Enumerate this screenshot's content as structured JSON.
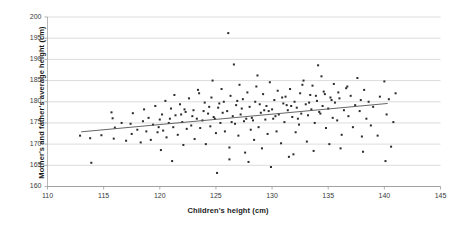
{
  "chart_data": {
    "type": "scatter",
    "title": "",
    "xlabel": "Children's height (cm)",
    "ylabel": "Mother's and father's average height (cm)",
    "xlim": [
      110,
      145
    ],
    "ylim": [
      160,
      200
    ],
    "xticks": [
      110,
      115,
      120,
      125,
      130,
      135,
      140,
      145
    ],
    "yticks": [
      160,
      165,
      170,
      175,
      180,
      185,
      190,
      195,
      200
    ],
    "grid": "horizontal",
    "legend": "none",
    "marker_color": "#2b2b2b",
    "marker_shape": "square",
    "marker_size_px": 2.0,
    "trendline": {
      "type": "linear",
      "color": "#555555",
      "x_start": 113.0,
      "y_start": 172.9,
      "x_end": 140.3,
      "y_end": 179.6,
      "slope": 0.245,
      "intercept": 145.2
    },
    "points": [
      [
        112.9,
        172.0
      ],
      [
        113.8,
        171.4
      ],
      [
        113.9,
        165.6
      ],
      [
        114.8,
        172.1
      ],
      [
        115.7,
        177.5
      ],
      [
        115.8,
        176.1
      ],
      [
        115.9,
        171.3
      ],
      [
        116.0,
        173.9
      ],
      [
        116.6,
        175.0
      ],
      [
        117.0,
        170.8
      ],
      [
        117.4,
        174.8
      ],
      [
        117.5,
        172.4
      ],
      [
        117.6,
        177.3
      ],
      [
        118.0,
        173.4
      ],
      [
        118.3,
        170.4
      ],
      [
        118.5,
        175.4
      ],
      [
        118.6,
        178.2
      ],
      [
        118.8,
        173.0
      ],
      [
        119.0,
        176.2
      ],
      [
        119.2,
        171.0
      ],
      [
        119.4,
        174.6
      ],
      [
        119.6,
        179.0
      ],
      [
        119.8,
        172.8
      ],
      [
        120.0,
        175.8
      ],
      [
        120.1,
        168.6
      ],
      [
        120.2,
        177.0
      ],
      [
        120.3,
        173.2
      ],
      [
        120.5,
        180.2
      ],
      [
        120.6,
        171.6
      ],
      [
        120.8,
        175.0
      ],
      [
        121.0,
        178.4
      ],
      [
        121.1,
        166.0
      ],
      [
        121.2,
        174.0
      ],
      [
        121.4,
        176.8
      ],
      [
        121.6,
        172.2
      ],
      [
        121.8,
        179.4
      ],
      [
        122.0,
        175.2
      ],
      [
        122.1,
        169.8
      ],
      [
        122.3,
        177.6
      ],
      [
        122.4,
        173.6
      ],
      [
        122.6,
        180.8
      ],
      [
        122.8,
        174.4
      ],
      [
        123.0,
        178.0
      ],
      [
        123.1,
        171.2
      ],
      [
        123.3,
        176.0
      ],
      [
        123.5,
        182.0
      ],
      [
        123.6,
        173.8
      ],
      [
        123.8,
        175.6
      ],
      [
        124.0,
        179.8
      ],
      [
        124.1,
        170.0
      ],
      [
        124.3,
        177.2
      ],
      [
        124.5,
        174.2
      ],
      [
        124.6,
        181.0
      ],
      [
        124.8,
        176.4
      ],
      [
        125.0,
        172.6
      ],
      [
        125.1,
        163.2
      ],
      [
        125.2,
        178.6
      ],
      [
        125.4,
        175.0
      ],
      [
        125.5,
        183.0
      ],
      [
        125.7,
        180.0
      ],
      [
        125.8,
        173.0
      ],
      [
        126.0,
        177.8
      ],
      [
        126.1,
        196.2
      ],
      [
        126.2,
        169.2
      ],
      [
        126.3,
        181.4
      ],
      [
        126.5,
        176.6
      ],
      [
        126.6,
        188.8
      ],
      [
        126.7,
        174.8
      ],
      [
        126.8,
        179.2
      ],
      [
        127.0,
        172.0
      ],
      [
        127.1,
        184.0
      ],
      [
        127.2,
        177.0
      ],
      [
        127.4,
        180.6
      ],
      [
        127.5,
        175.4
      ],
      [
        127.6,
        168.0
      ],
      [
        127.8,
        182.2
      ],
      [
        128.0,
        178.8
      ],
      [
        128.1,
        173.4
      ],
      [
        128.2,
        176.2
      ],
      [
        128.4,
        171.0
      ],
      [
        128.5,
        180.0
      ],
      [
        128.6,
        183.6
      ],
      [
        128.8,
        174.0
      ],
      [
        129.0,
        177.4
      ],
      [
        129.1,
        169.0
      ],
      [
        129.2,
        181.8
      ],
      [
        129.4,
        175.8
      ],
      [
        129.5,
        179.0
      ],
      [
        129.6,
        172.4
      ],
      [
        129.8,
        184.6
      ],
      [
        130.0,
        178.2
      ],
      [
        130.1,
        176.0
      ],
      [
        130.2,
        180.4
      ],
      [
        130.4,
        173.0
      ],
      [
        130.5,
        182.6
      ],
      [
        130.6,
        177.0
      ],
      [
        130.8,
        170.2
      ],
      [
        131.0,
        179.6
      ],
      [
        131.1,
        175.2
      ],
      [
        131.2,
        181.2
      ],
      [
        131.4,
        178.0
      ],
      [
        131.5,
        167.0
      ],
      [
        131.6,
        183.0
      ],
      [
        131.8,
        176.4
      ],
      [
        132.0,
        180.0
      ],
      [
        132.1,
        172.8
      ],
      [
        132.2,
        178.6
      ],
      [
        132.4,
        174.6
      ],
      [
        132.5,
        182.0
      ],
      [
        132.6,
        177.2
      ],
      [
        132.8,
        185.0
      ],
      [
        133.0,
        179.4
      ],
      [
        133.1,
        170.6
      ],
      [
        133.2,
        176.8
      ],
      [
        133.4,
        181.6
      ],
      [
        133.5,
        178.2
      ],
      [
        133.6,
        183.8
      ],
      [
        133.8,
        175.0
      ],
      [
        134.0,
        180.2
      ],
      [
        134.1,
        188.6
      ],
      [
        134.2,
        177.6
      ],
      [
        134.4,
        186.0
      ],
      [
        134.5,
        179.0
      ],
      [
        134.6,
        182.4
      ],
      [
        134.8,
        173.8
      ],
      [
        135.0,
        178.4
      ],
      [
        135.1,
        170.0
      ],
      [
        135.2,
        181.0
      ],
      [
        135.4,
        176.2
      ],
      [
        135.5,
        184.2
      ],
      [
        135.6,
        179.8
      ],
      [
        135.8,
        175.6
      ],
      [
        136.0,
        180.8
      ],
      [
        136.2,
        172.2
      ],
      [
        136.4,
        178.0
      ],
      [
        136.6,
        183.2
      ],
      [
        136.8,
        176.6
      ],
      [
        137.0,
        181.4
      ],
      [
        137.2,
        174.0
      ],
      [
        137.4,
        179.2
      ],
      [
        137.6,
        185.6
      ],
      [
        137.8,
        177.8
      ],
      [
        138.0,
        171.8
      ],
      [
        138.2,
        182.8
      ],
      [
        138.4,
        176.0
      ],
      [
        138.6,
        180.0
      ],
      [
        138.8,
        174.4
      ],
      [
        139.0,
        178.8
      ],
      [
        139.4,
        172.0
      ],
      [
        139.6,
        181.2
      ],
      [
        140.0,
        184.8
      ],
      [
        140.2,
        177.0
      ],
      [
        140.4,
        180.6
      ],
      [
        140.6,
        169.4
      ],
      [
        140.8,
        175.2
      ],
      [
        141.0,
        182.0
      ],
      [
        124.9,
        176.0
      ],
      [
        125.3,
        179.6
      ],
      [
        126.4,
        175.2
      ],
      [
        127.3,
        178.4
      ],
      [
        128.3,
        175.6
      ],
      [
        129.3,
        178.0
      ],
      [
        130.3,
        176.6
      ],
      [
        131.3,
        179.2
      ],
      [
        132.3,
        176.0
      ],
      [
        133.3,
        179.8
      ],
      [
        134.3,
        177.2
      ],
      [
        135.3,
        180.4
      ],
      [
        122.9,
        176.6
      ],
      [
        123.9,
        177.8
      ],
      [
        124.4,
        178.8
      ],
      [
        126.9,
        180.2
      ],
      [
        128.9,
        179.4
      ],
      [
        130.9,
        181.0
      ],
      [
        133.9,
        181.4
      ],
      [
        134.7,
        181.8
      ],
      [
        119.9,
        174.0
      ],
      [
        120.9,
        176.0
      ],
      [
        121.9,
        177.0
      ],
      [
        122.2,
        178.2
      ],
      [
        125.6,
        177.4
      ],
      [
        127.7,
        176.0
      ],
      [
        129.7,
        177.8
      ],
      [
        131.7,
        179.0
      ],
      [
        126.2,
        166.4
      ],
      [
        127.9,
        165.8
      ],
      [
        131.9,
        167.6
      ],
      [
        133.7,
        168.4
      ],
      [
        136.1,
        169.0
      ],
      [
        138.1,
        168.2
      ],
      [
        140.1,
        166.0
      ],
      [
        129.9,
        164.6
      ],
      [
        124.7,
        185.0
      ],
      [
        128.7,
        186.2
      ],
      [
        132.7,
        184.0
      ],
      [
        136.7,
        183.6
      ],
      [
        121.3,
        181.6
      ],
      [
        123.4,
        182.8
      ],
      [
        135.9,
        182.2
      ],
      [
        137.9,
        180.4
      ]
    ]
  }
}
